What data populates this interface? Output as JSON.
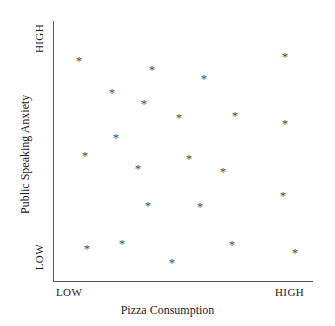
{
  "chart_data": {
    "type": "scatter",
    "title": "",
    "xlabel": "Pizza Consumption",
    "ylabel": "Public Speaking Anxiety",
    "xtick_labels": [
      "LOW",
      "HIGH"
    ],
    "ytick_labels": [
      "LOW",
      "HIGH"
    ],
    "xlim": [
      0,
      100
    ],
    "ylim": [
      0,
      100
    ],
    "grid": false,
    "legend": null,
    "marker": "*",
    "marker_color": "#4a4a4a",
    "axis_color": "#555555",
    "n_points": 22,
    "points": [
      {
        "x": 10.0,
        "y": 85.0
      },
      {
        "x": 38.1,
        "y": 81.5
      },
      {
        "x": 89.2,
        "y": 86.5
      },
      {
        "x": 22.7,
        "y": 72.7
      },
      {
        "x": 58.1,
        "y": 78.1
      },
      {
        "x": 35.0,
        "y": 68.5
      },
      {
        "x": 48.5,
        "y": 63.1
      },
      {
        "x": 70.0,
        "y": 63.8
      },
      {
        "x": 89.2,
        "y": 60.8
      },
      {
        "x": 24.2,
        "y": 55.4
      },
      {
        "x": 12.3,
        "y": 48.5
      },
      {
        "x": 52.3,
        "y": 47.3
      },
      {
        "x": 32.7,
        "y": 43.5
      },
      {
        "x": 65.4,
        "y": 42.3
      },
      {
        "x": 88.5,
        "y": 33.1
      },
      {
        "x": 36.5,
        "y": 29.2
      },
      {
        "x": 56.5,
        "y": 28.8
      },
      {
        "x": 13.1,
        "y": 12.7
      },
      {
        "x": 26.5,
        "y": 14.6
      },
      {
        "x": 68.8,
        "y": 14.2
      },
      {
        "x": 45.8,
        "y": 7.3
      },
      {
        "x": 93.1,
        "y": 11.2
      }
    ]
  }
}
